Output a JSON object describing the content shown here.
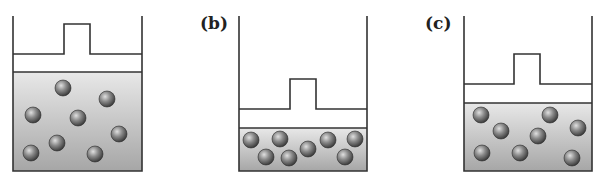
{
  "figure": {
    "panels": [
      {
        "id": "a",
        "label": "",
        "state": "initial",
        "container": {
          "left": 13,
          "right": 142,
          "top": 16,
          "bottom": 171
        },
        "piston": {
          "plate_y": 54,
          "knob_left": 64,
          "knob_right": 90,
          "knob_top": 24
        },
        "gas_top": 72,
        "particles": [
          [
            63,
            88
          ],
          [
            107,
            99
          ],
          [
            33,
            115
          ],
          [
            78,
            118
          ],
          [
            119,
            134
          ],
          [
            57,
            143
          ],
          [
            31,
            153
          ],
          [
            95,
            154
          ]
        ]
      },
      {
        "id": "b",
        "label": "(b)",
        "state": "compressed",
        "container": {
          "left": 239,
          "right": 367,
          "top": 16,
          "bottom": 171
        },
        "piston": {
          "plate_y": 109,
          "knob_left": 290,
          "knob_right": 316,
          "knob_top": 79
        },
        "gas_top": 128,
        "particles": [
          [
            251,
            140
          ],
          [
            280,
            139
          ],
          [
            328,
            140
          ],
          [
            355,
            139
          ],
          [
            266,
            157
          ],
          [
            289,
            158
          ],
          [
            308,
            149
          ],
          [
            345,
            157
          ]
        ]
      },
      {
        "id": "c",
        "label": "(c)",
        "state": "intermediate",
        "container": {
          "left": 464,
          "right": 592,
          "top": 16,
          "bottom": 171
        },
        "piston": {
          "plate_y": 84,
          "knob_left": 514,
          "knob_right": 540,
          "knob_top": 54
        },
        "gas_top": 103,
        "particles": [
          [
            481,
            115
          ],
          [
            550,
            115
          ],
          [
            501,
            131
          ],
          [
            538,
            136
          ],
          [
            578,
            128
          ],
          [
            482,
            153
          ],
          [
            520,
            153
          ],
          [
            572,
            158
          ]
        ]
      }
    ],
    "colors": {
      "line": "#333333",
      "gas_top": "#e6e6e6",
      "gas_bottom": "#a8a8a8",
      "particle_light": "#d8d8d8",
      "particle_dark": "#3a3a3a"
    }
  }
}
